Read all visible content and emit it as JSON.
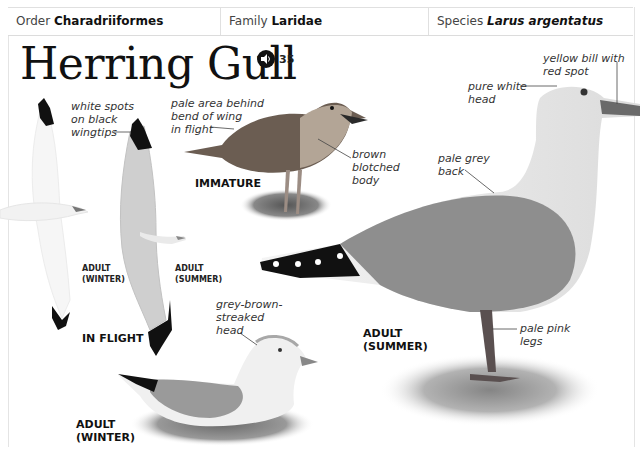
{
  "taxonomy": {
    "order_label": "Order",
    "order_value": "Charadriiformes",
    "family_label": "Family",
    "family_value": "Laridae",
    "species_label": "Species",
    "species_value": "Larus argentatus"
  },
  "title": "Herring Gull",
  "audio": {
    "icon": "speaker-icon",
    "track_number": "35"
  },
  "illustrations": [
    {
      "id": "in-flight",
      "caption": "IN FLIGHT",
      "sub_captions": [
        {
          "line1": "ADULT",
          "line2": "(WINTER)"
        },
        {
          "line1": "ADULT",
          "line2": "(SUMMER)"
        }
      ],
      "annotations": [
        {
          "text": [
            "white spots",
            "on black",
            "wingtips"
          ]
        }
      ]
    },
    {
      "id": "immature",
      "caption": "IMMATURE",
      "annotations": [
        {
          "text": [
            "pale area behind",
            "bend of wing",
            "in flight"
          ]
        },
        {
          "text": [
            "brown",
            "blotched",
            "body"
          ]
        }
      ]
    },
    {
      "id": "adult-summer",
      "caption_line1": "ADULT",
      "caption_line2": "(SUMMER)",
      "annotations": [
        {
          "text": [
            "yellow bill with",
            "red spot"
          ]
        },
        {
          "text": [
            "pure white",
            "head"
          ]
        },
        {
          "text": [
            "pale grey",
            "back"
          ]
        },
        {
          "text": [
            "pale pink",
            "legs"
          ]
        }
      ]
    },
    {
      "id": "adult-winter",
      "caption_line1": "ADULT",
      "caption_line2": "(WINTER)",
      "annotations": [
        {
          "text": [
            "grey-brown-",
            "streaked",
            "head"
          ]
        }
      ]
    }
  ]
}
